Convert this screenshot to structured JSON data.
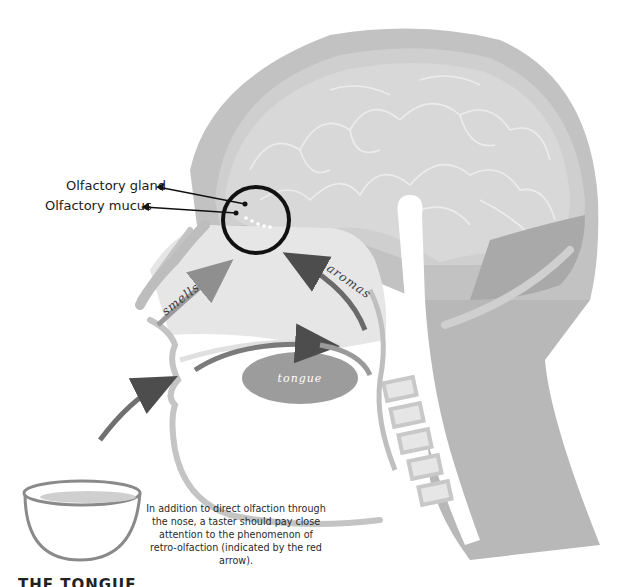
{
  "diagram": {
    "labels": {
      "olfactory_gland": "Olfactory gland",
      "olfactory_mucus": "Olfactory mucus",
      "smells": "smells",
      "aromas": "aromas",
      "tongue": "tongue"
    },
    "caption": "In addition to direct olfaction through the nose, a taster should pay close attention to the phenomenon of retro-olfaction (indicated by the red arrow).",
    "section_heading": "THE TONGUE",
    "colors": {
      "skull": "#bdbdbd",
      "brain": "#d6d6d6",
      "brain_folds": "#e8e8e8",
      "nasal_cavity": "#e4e4e4",
      "neck": "#b8b8b8",
      "tongue": "#9a9a9a",
      "arrow_dark": "#555555",
      "arrow_light": "#a0a0a0",
      "circle": "#111111",
      "text": "#1a1a1a"
    }
  }
}
